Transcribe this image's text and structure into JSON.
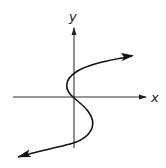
{
  "diagram": {
    "type": "function-graph-sketch",
    "axes": {
      "x_label": "x",
      "y_label": "y",
      "color": "#222222"
    },
    "curve": {
      "color": "#111111",
      "shape": "sideways S through origin",
      "ends": [
        "arrow upper-right",
        "arrow lower-left"
      ]
    }
  }
}
